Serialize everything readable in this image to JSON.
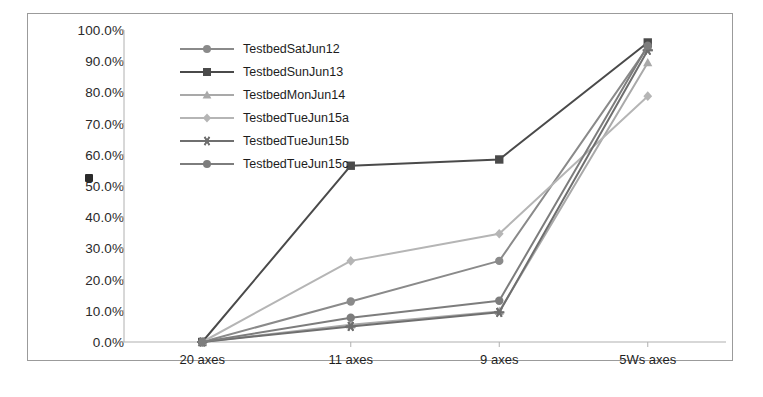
{
  "chart_data": {
    "type": "line",
    "title": "",
    "xlabel": "",
    "ylabel": "",
    "categories": [
      "20 axes",
      "11 axes",
      "9 axes",
      "5Ws axes"
    ],
    "ylim": [
      0,
      100
    ],
    "ytick_labels": [
      "0.0%",
      "10.0%",
      "20.0%",
      "30.0%",
      "40.0%",
      "50.0%",
      "60.0%",
      "70.0%",
      "80.0%",
      "90.0%",
      "100.0%"
    ],
    "ytick_values": [
      0,
      10,
      20,
      30,
      40,
      50,
      60,
      70,
      80,
      90,
      100
    ],
    "grid": false,
    "legend_position": "upper-left-inside",
    "series": [
      {
        "name": "TestbedSatJun12",
        "marker": "circle",
        "color": "#8a8a8a",
        "values": [
          0.0,
          13.0,
          26.0,
          94.5
        ]
      },
      {
        "name": "TestbedSunJun13",
        "marker": "square",
        "color": "#4a4a4a",
        "values": [
          0.0,
          56.5,
          58.5,
          96.0
        ]
      },
      {
        "name": "TestbedMonJun14",
        "marker": "triangle",
        "color": "#a9a9a9",
        "values": [
          0.0,
          5.5,
          9.8,
          89.5
        ]
      },
      {
        "name": "TestbedTueJun15a",
        "marker": "diamond",
        "color": "#b5b5b5",
        "values": [
          0.0,
          26.0,
          34.7,
          78.8
        ]
      },
      {
        "name": "TestbedTueJun15b",
        "marker": "asterisk",
        "color": "#6f6f6f",
        "values": [
          0.0,
          5.0,
          9.5,
          93.5
        ]
      },
      {
        "name": "TestbedTueJun15c",
        "marker": "circle",
        "color": "#7d7d7d",
        "values": [
          0.0,
          7.8,
          13.2,
          95.0
        ]
      }
    ]
  },
  "legend": {
    "items": [
      {
        "label": "TestbedSatJun12"
      },
      {
        "label": "TestbedSunJun13"
      },
      {
        "label": "TestbedMonJun14"
      },
      {
        "label": "TestbedTueJun15a"
      },
      {
        "label": "TestbedTueJun15b"
      },
      {
        "label": "TestbedTueJun15c"
      }
    ]
  },
  "colors": {
    "frame_border": "#9b9b9b",
    "axis_line": "#b0b0b0",
    "tick_text": "#2a2a2a",
    "background": "#ffffff"
  }
}
